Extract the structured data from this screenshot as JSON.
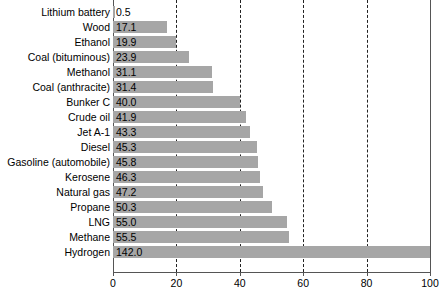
{
  "chart_data": {
    "type": "bar",
    "orientation": "horizontal",
    "title": "",
    "subtitle": "",
    "xlabel": "",
    "ylabel": "",
    "xlim": [
      0,
      100
    ],
    "xticks": [
      0,
      20,
      40,
      60,
      80,
      100
    ],
    "xtick_labels": [
      "0",
      "20",
      "40",
      "60",
      "80",
      "100"
    ],
    "grid": true,
    "grid_axis": "x",
    "grid_style": "dashed",
    "legend": false,
    "bar_color": "#a6a6a6",
    "value_label_color": "#000000",
    "note": "Hydrogen bar value 142.0 exceeds axis maximum 100 and is clipped at the plot edge.",
    "categories": [
      "Lithium battery",
      "Wood",
      "Ethanol",
      "Coal (bituminous)",
      "Methanol",
      "Coal (anthracite)",
      "Bunker C",
      "Crude oil",
      "Jet A-1",
      "Diesel",
      "Gasoline (automobile)",
      "Kerosene",
      "Natural gas",
      "Propane",
      "LNG",
      "Methane",
      "Hydrogen"
    ],
    "values": [
      0.5,
      17.1,
      19.9,
      23.9,
      31.1,
      31.4,
      40.0,
      41.9,
      43.3,
      45.3,
      45.8,
      46.3,
      47.2,
      50.3,
      55.0,
      55.5,
      142.0
    ],
    "value_labels": [
      "0.5",
      "17.1",
      "19.9",
      "23.9",
      "31.1",
      "31.4",
      "40.0",
      "41.9",
      "43.3",
      "45.3",
      "45.8",
      "46.3",
      "47.2",
      "50.3",
      "55.0",
      "55.5",
      "142.0"
    ]
  }
}
